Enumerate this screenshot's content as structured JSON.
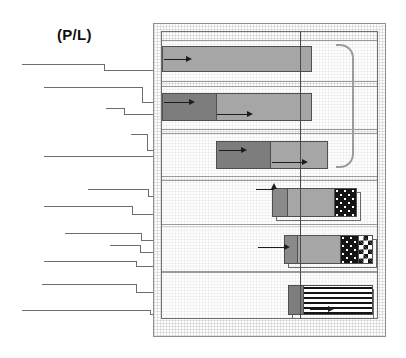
{
  "figure": {
    "title": "(P/L)",
    "title_x": 57,
    "title_y": 26,
    "width": 406,
    "height": 358,
    "background": "#ffffff"
  },
  "colors": {
    "panel_border": "#8e8e8e",
    "inner_border": "#6f6f6f",
    "band_border": "#9a9a9a",
    "bar_border": "#4f4f4f",
    "leader_line": "#6d6d6d",
    "arrow": "#1d1d1d",
    "reference_line": "#4a4a4a",
    "bracket": "#9b9b9b",
    "fill_gray": "#a6a6a6",
    "fill_dark_gray": "#8a8a8a",
    "fill_deep_gray": "#7d7d7d",
    "fill_dots": "#141414",
    "fill_check": "#141414",
    "fill_stripes": "#141414"
  },
  "panel": {
    "outer": {
      "x": 153,
      "y": 23,
      "w": 233,
      "h": 314
    },
    "inner": {
      "x": 161,
      "y": 31,
      "w": 217,
      "h": 288
    }
  },
  "reference_line": {
    "x": 300,
    "y": 31,
    "h": 288
  },
  "bracket": {
    "x": 336,
    "y": 44,
    "w": 18,
    "h": 124
  },
  "bands": [
    {
      "name": "band-1",
      "x": 161,
      "y": 40,
      "w": 217,
      "h": 42
    },
    {
      "name": "band-2",
      "x": 161,
      "y": 86,
      "w": 217,
      "h": 44
    },
    {
      "name": "band-3",
      "x": 161,
      "y": 133,
      "w": 217,
      "h": 44
    },
    {
      "name": "band-4",
      "x": 161,
      "y": 180,
      "w": 217,
      "h": 47
    },
    {
      "name": "band-5",
      "x": 161,
      "y": 224,
      "w": 217,
      "h": 48
    },
    {
      "name": "band-6",
      "x": 161,
      "y": 272,
      "w": 217,
      "h": 47
    }
  ],
  "bars": [
    {
      "name": "bar-track-1",
      "x": 162,
      "y": 46,
      "w": 150,
      "h": 26,
      "segments": [
        {
          "name": "segment-body",
          "fill": "fill-gray",
          "w": 150
        }
      ]
    },
    {
      "name": "bar-track-2",
      "x": 162,
      "y": 93,
      "w": 150,
      "h": 28,
      "segments": [
        {
          "name": "segment-head",
          "fill": "fill-deepgray",
          "w": 54
        },
        {
          "name": "segment-body",
          "fill": "fill-gray",
          "w": 96
        }
      ]
    },
    {
      "name": "bar-track-3",
      "x": 216,
      "y": 141,
      "w": 112,
      "h": 28,
      "segments": [
        {
          "name": "segment-head",
          "fill": "fill-deepgray",
          "w": 54
        },
        {
          "name": "segment-body",
          "fill": "fill-gray",
          "w": 58
        }
      ]
    },
    {
      "name": "bar-track-4",
      "x": 272,
      "y": 188,
      "w": 85,
      "h": 29,
      "segments": [
        {
          "name": "segment-head",
          "fill": "fill-darkgray",
          "w": 14
        },
        {
          "name": "segment-body",
          "fill": "fill-gray",
          "w": 48
        },
        {
          "name": "segment-dots",
          "fill": "fill-dots",
          "w": 23
        }
      ]
    },
    {
      "name": "bar-track-5",
      "x": 284,
      "y": 235,
      "w": 89,
      "h": 29,
      "segments": [
        {
          "name": "segment-head",
          "fill": "fill-darkgray",
          "w": 12
        },
        {
          "name": "segment-body",
          "fill": "fill-gray",
          "w": 44
        },
        {
          "name": "segment-dots",
          "fill": "fill-dots",
          "w": 19
        },
        {
          "name": "segment-check",
          "fill": "fill-check",
          "w": 14
        }
      ]
    },
    {
      "name": "bar-track-6",
      "x": 288,
      "y": 285,
      "w": 85,
      "h": 30,
      "segments": [
        {
          "name": "segment-head",
          "fill": "fill-deepgray",
          "w": 14
        },
        {
          "name": "segment-stripes",
          "fill": "fill-stripes",
          "w": 71
        }
      ]
    }
  ],
  "bar_shadows": [
    {
      "name": "bar-shadow-4",
      "x": 276,
      "y": 192,
      "w": 85,
      "h": 29
    },
    {
      "name": "bar-shadow-5",
      "x": 288,
      "y": 239,
      "w": 89,
      "h": 29
    },
    {
      "name": "bar-shadow-6",
      "x": 292,
      "y": 289,
      "w": 82,
      "h": 30
    }
  ],
  "arrows": [
    {
      "name": "arrow-track-1-entry",
      "x": 164,
      "y": 59,
      "len": 22,
      "dir": "right"
    },
    {
      "name": "arrow-track-2-entry",
      "x": 164,
      "y": 102,
      "len": 25,
      "dir": "right"
    },
    {
      "name": "arrow-track-2-second",
      "x": 217,
      "y": 114,
      "len": 30,
      "dir": "right"
    },
    {
      "name": "arrow-track-3-entry",
      "x": 219,
      "y": 150,
      "len": 22,
      "dir": "right"
    },
    {
      "name": "arrow-track-3-second",
      "x": 272,
      "y": 162,
      "len": 30,
      "dir": "right"
    },
    {
      "name": "arrow-track-4-entry",
      "x": 256,
      "y": 189,
      "len": 18,
      "dir": "up"
    },
    {
      "name": "arrow-track-5-entry",
      "x": 258,
      "y": 247,
      "len": 26,
      "dir": "right"
    },
    {
      "name": "arrow-track-6-exit",
      "x": 310,
      "y": 309,
      "len": 18,
      "dir": "right"
    }
  ],
  "leader_lines": [
    {
      "name": "leader-1",
      "y1": 64,
      "x1": 22,
      "x2": 104,
      "y2": 70,
      "x3": 186
    },
    {
      "name": "leader-2",
      "y1": 87,
      "x1": 44,
      "x2": 142,
      "y2": 102,
      "x3": 190
    },
    {
      "name": "leader-3",
      "y1": 108,
      "x1": 106,
      "x2": 124,
      "y2": 114,
      "x3": 218
    },
    {
      "name": "leader-4",
      "y1": 134,
      "x1": 131,
      "x2": 147,
      "y2": 150,
      "x3": 219
    },
    {
      "name": "leader-5",
      "y1": 156,
      "x1": 44,
      "x2": 160,
      "y2": 162,
      "x3": 274
    },
    {
      "name": "leader-6",
      "y1": 189,
      "x1": 88,
      "x2": 148,
      "y2": 196,
      "x3": 258
    },
    {
      "name": "leader-7",
      "y1": 206,
      "x1": 44,
      "x2": 132,
      "y2": 214,
      "x3": 276
    },
    {
      "name": "leader-8",
      "y1": 233,
      "x1": 65,
      "x2": 141,
      "y2": 240,
      "x3": 260
    },
    {
      "name": "leader-9",
      "y1": 245,
      "x1": 110,
      "x2": 140,
      "y2": 252,
      "x3": 290
    },
    {
      "name": "leader-10",
      "y1": 261,
      "x1": 44,
      "x2": 136,
      "y2": 266,
      "x3": 292
    },
    {
      "name": "leader-11",
      "y1": 284,
      "x1": 42,
      "x2": 136,
      "y2": 292,
      "x3": 292
    },
    {
      "name": "leader-12",
      "y1": 310,
      "x1": 22,
      "x2": 150,
      "y2": 314,
      "x3": 295
    }
  ]
}
